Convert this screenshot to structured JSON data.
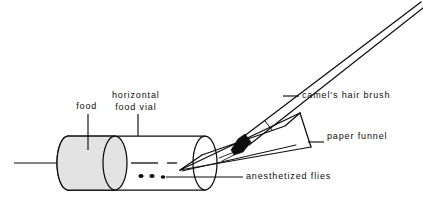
{
  "figure": {
    "background_color": "#ffffff",
    "ink_color": "#0d0d0d",
    "food_fill_color": "#e3e3e3"
  },
  "labels": {
    "food": "food",
    "horizontal_food_vial_line1": "horizontal",
    "horizontal_food_vial_line2": "food vial",
    "camels_hair_brush": "camel's hair brush",
    "paper_funnel": "paper funnel",
    "anesthetized_flies": "anesthetized flies"
  },
  "parts": {
    "vial": "horizontal-food-vial",
    "food_plug": "food-plug",
    "funnel": "paper-funnel",
    "brush": "camels-hair-brush",
    "brush_tip": "brush-bristle-tip",
    "flies": "anesthetized-flies",
    "fly_count": 3
  }
}
